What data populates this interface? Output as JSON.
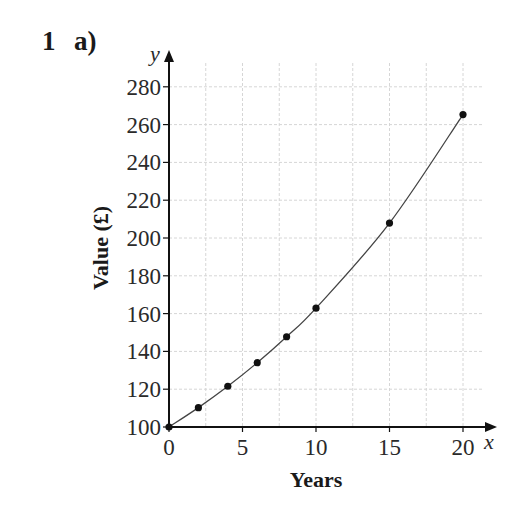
{
  "question": {
    "number": "1",
    "part": "a)"
  },
  "chart_data": {
    "type": "line",
    "title": "",
    "xlabel": "Years",
    "ylabel": "Value (£)",
    "x_axis_var": "x",
    "y_axis_var": "y",
    "xlim": [
      0,
      21
    ],
    "ylim": [
      100,
      280
    ],
    "x_ticks": [
      0,
      5,
      10,
      15,
      20
    ],
    "y_ticks": [
      100,
      120,
      140,
      160,
      180,
      200,
      220,
      240,
      260,
      280
    ],
    "grid": true,
    "x_grid_step": 2.5,
    "y_grid_step": 20,
    "legend": null,
    "series": [
      {
        "name": "Value",
        "markers": true,
        "smooth": true,
        "x": [
          0,
          2,
          4,
          6,
          8,
          10,
          15,
          20
        ],
        "y": [
          100,
          110.25,
          121.55,
          134.01,
          147.75,
          162.89,
          207.89,
          265.33
        ]
      }
    ]
  },
  "colors": {
    "axis": "#111111",
    "grid": "#d6d6d6",
    "line": "#444444",
    "marker": "#111111"
  }
}
